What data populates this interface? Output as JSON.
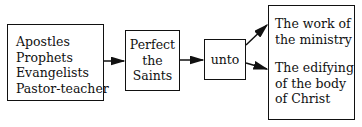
{
  "diagram": {
    "boxes": [
      {
        "id": "gifts",
        "lines": [
          "Apostles",
          "Prophets",
          "Evangelists",
          "Pastor-teacher"
        ]
      },
      {
        "id": "perfect",
        "lines": [
          "Perfect",
          "the",
          "Saints"
        ]
      },
      {
        "id": "unto",
        "lines": [
          "unto"
        ]
      },
      {
        "id": "outcomes",
        "groups": [
          [
            "The work of",
            "the ministry"
          ],
          [
            "The edifying",
            "of the body",
            "of Christ"
          ]
        ]
      }
    ],
    "edges": [
      {
        "from": "gifts",
        "to": "perfect"
      },
      {
        "from": "perfect",
        "to": "unto"
      },
      {
        "from": "unto",
        "to": "outcomes.0"
      },
      {
        "from": "unto",
        "to": "outcomes.1"
      }
    ]
  }
}
